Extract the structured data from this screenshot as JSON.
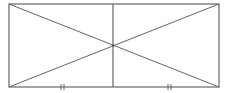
{
  "diagram": {
    "type": "geometry",
    "stroke_color": "#666666",
    "rectangle": {
      "x1": 9,
      "y1": 4,
      "x2": 219,
      "y2": 87
    },
    "diagonals": [
      {
        "from": [
          9,
          4
        ],
        "to": [
          219,
          87
        ]
      },
      {
        "from": [
          219,
          4
        ],
        "to": [
          9,
          87
        ]
      }
    ],
    "vertical_segment": {
      "x": 113,
      "y1": 4,
      "y2": 87
    },
    "intersection": {
      "x": 113,
      "y": 45
    },
    "equal_marks": [
      {
        "x": 62,
        "y": 87,
        "count": 2
      },
      {
        "x": 170,
        "y": 87,
        "count": 2
      }
    ],
    "labels": []
  }
}
